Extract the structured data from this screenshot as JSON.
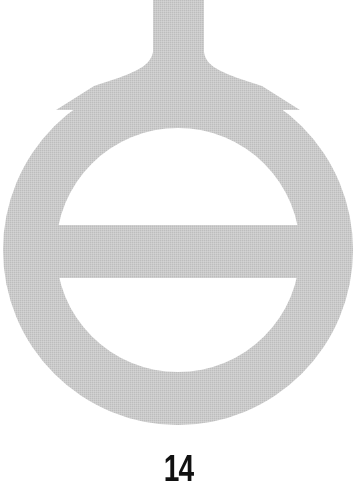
{
  "figure": {
    "fill_color": "#c8c8c8",
    "background_color": "#ffffff",
    "shapes": {
      "ring": {
        "cx": 178,
        "cy": 250,
        "outer_r": 175,
        "inner_r": 122
      },
      "stem": {
        "x": 153,
        "y": 0,
        "width": 51,
        "height": 90
      },
      "bar": {
        "x": 55,
        "y": 225,
        "width": 246,
        "height": 53
      }
    }
  },
  "label": {
    "text": "14",
    "color": "#111111"
  }
}
